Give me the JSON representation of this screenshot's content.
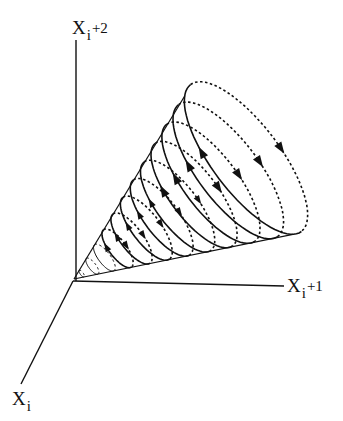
{
  "diagram": {
    "type": "3d-phase-space-cone",
    "axes": [
      {
        "id": "z",
        "label_base": "X",
        "label_sub": "i",
        "label_suffix": "+2"
      },
      {
        "id": "y",
        "label_base": "X",
        "label_sub": "i",
        "label_suffix": "+1"
      },
      {
        "id": "x",
        "label_base": "X",
        "label_sub": "i",
        "label_suffix": ""
      }
    ],
    "ring_count": 12,
    "colors": {
      "stroke": "#111111",
      "background": "#ffffff"
    }
  }
}
